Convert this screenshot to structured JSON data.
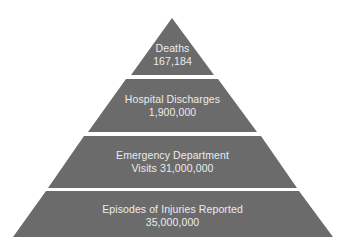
{
  "diagram": {
    "type": "pyramid",
    "colors": {
      "tier_fill": "#6b6b6b",
      "label_text": "#ececec",
      "background": "#ffffff"
    },
    "tiers": [
      {
        "line1": "Deaths",
        "line2": "167,184"
      },
      {
        "line1": "Hospital Discharges",
        "line2": "1,900,000"
      },
      {
        "line1": "Emergency Department",
        "line2": "Visits 31,000,000"
      },
      {
        "line1": "Episodes of Injuries Reported",
        "line2": "35,000,000"
      }
    ]
  }
}
